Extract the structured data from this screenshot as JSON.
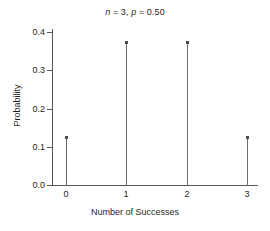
{
  "chart_data": {
    "type": "scatter",
    "title": "n = 3, p = 0.50",
    "title_parts": {
      "n_symbol": "n",
      "n_eq": " = 3, ",
      "p_symbol": "p",
      "p_eq": " = 0.50"
    },
    "xlabel": "Number of Successes",
    "ylabel": "Probability",
    "categories": [
      0,
      1,
      2,
      3
    ],
    "x": [
      0,
      1,
      2,
      3
    ],
    "values": [
      0.125,
      0.375,
      0.375,
      0.125
    ],
    "xticklabels": [
      "0",
      "1",
      "2",
      "3"
    ],
    "yticklabels": [
      "0.0",
      "0.1",
      "0.2",
      "0.3",
      "0.4"
    ],
    "ytickvalues": [
      0.0,
      0.1,
      0.2,
      0.3,
      0.4
    ],
    "xlim": [
      -0.25,
      3.4
    ],
    "ylim": [
      0.0,
      0.41
    ],
    "grid": false,
    "legend": false,
    "marker": "square-dot",
    "stems": true,
    "colors": {
      "axis": "#58595b",
      "stem": "#6d6e71",
      "marker": "#4d4d4f",
      "text": "#231f20",
      "background": "#ffffff"
    }
  },
  "geometry": {
    "plot_left": 52,
    "plot_top": 29,
    "plot_bottom": 185,
    "plot_right": 258,
    "x_px": [
      66,
      126,
      187,
      247
    ],
    "y0_px": 185,
    "px_per_0_1": 38.25
  }
}
